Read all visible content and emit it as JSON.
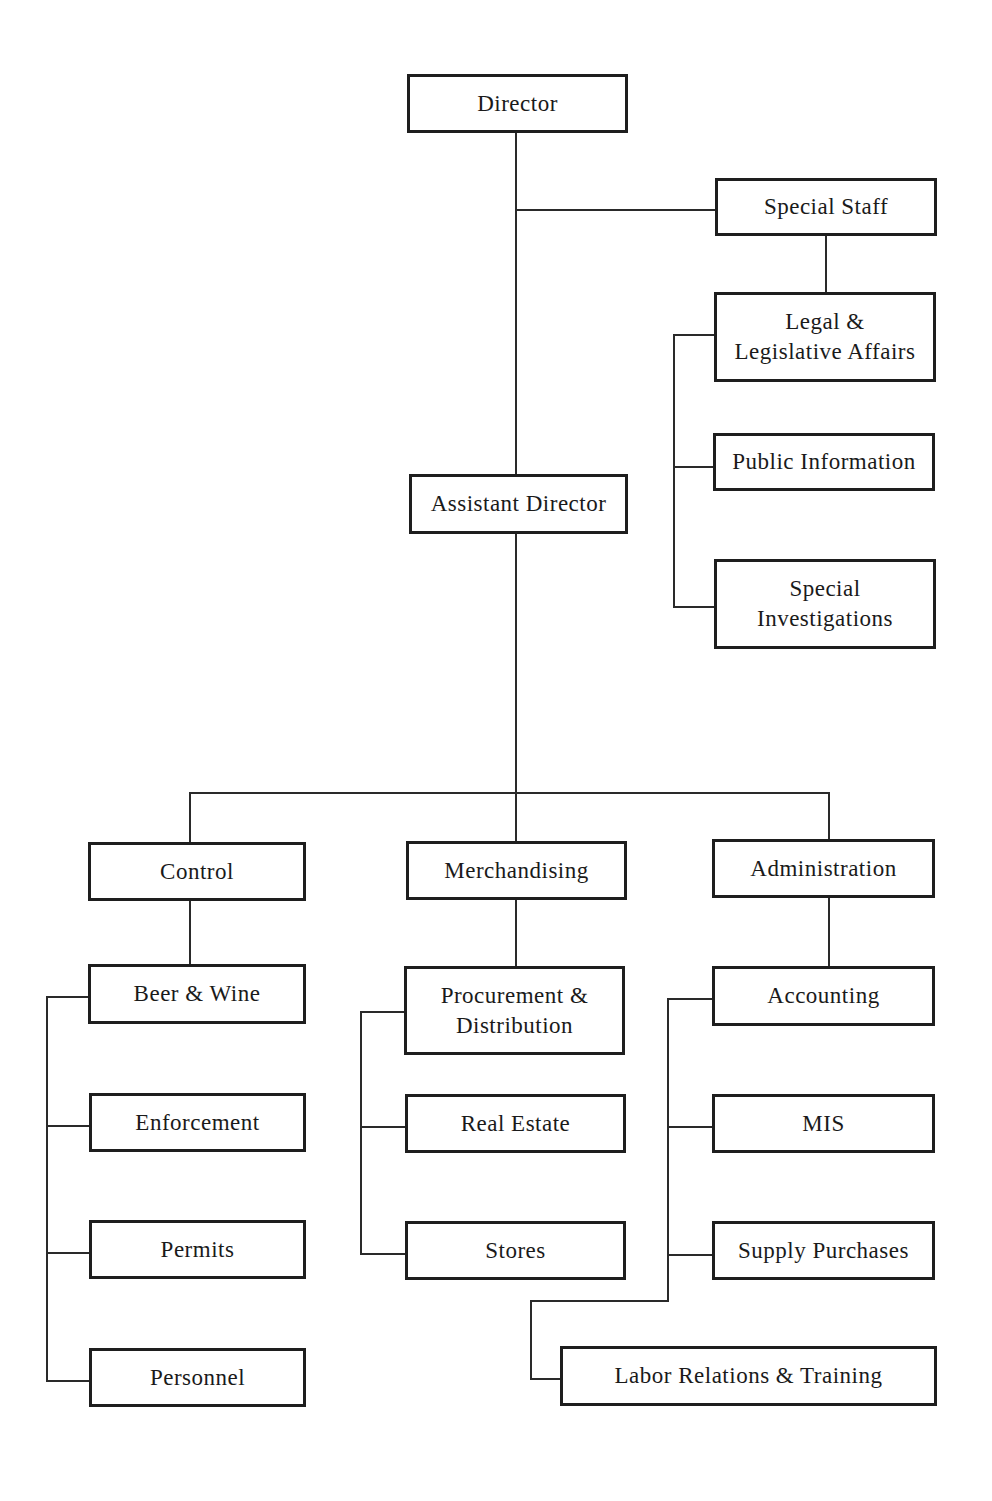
{
  "chart": {
    "type": "org-chart",
    "nodes": {
      "director": "Director",
      "special_staff": "Special Staff",
      "legal": "Legal &\nLegislative Affairs",
      "public_info": "Public Information",
      "special_investigations": "Special\nInvestigations",
      "assistant_director": "Assistant Director",
      "control": "Control",
      "merchandising": "Merchandising",
      "administration": "Administration",
      "beer_wine": "Beer & Wine",
      "enforcement": "Enforcement",
      "permits": "Permits",
      "personnel": "Personnel",
      "procurement": "Procurement &\nDistribution",
      "real_estate": "Real Estate",
      "stores": "Stores",
      "accounting": "Accounting",
      "mis": "MIS",
      "supply_purchases": "Supply Purchases",
      "labor_relations": "Labor Relations & Training"
    },
    "hierarchy": {
      "Director": {
        "Special Staff": [
          "Legal & Legislative Affairs",
          "Public Information",
          "Special Investigations"
        ],
        "Assistant Director": {
          "Control": [
            "Beer & Wine",
            "Enforcement",
            "Permits",
            "Personnel"
          ],
          "Merchandising": [
            "Procurement & Distribution",
            "Real Estate",
            "Stores"
          ],
          "Administration": [
            "Accounting",
            "MIS",
            "Supply Purchases",
            "Labor Relations & Training"
          ]
        }
      }
    }
  }
}
